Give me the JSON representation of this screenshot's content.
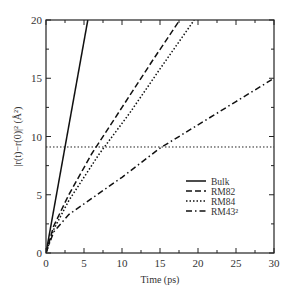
{
  "chart_data": {
    "type": "line",
    "title": "",
    "xlabel": "Time (ps)",
    "ylabel": "|r(t)−r(0)|² (Å²)",
    "xlim": [
      0,
      30
    ],
    "ylim": [
      0,
      20
    ],
    "xticks": [
      0,
      5,
      10,
      15,
      20,
      25,
      30
    ],
    "yticks": [
      0,
      5,
      10,
      15,
      20
    ],
    "legend_position": "center-right",
    "series": [
      {
        "name": "Bulk",
        "style": "solid",
        "x": [
          0,
          5.5
        ],
        "y": [
          0,
          20
        ]
      },
      {
        "name": "RM82",
        "style": "dashed",
        "x": [
          0,
          1,
          3,
          6,
          10,
          14,
          17.6
        ],
        "y": [
          0,
          2.3,
          5,
          8.5,
          12.5,
          16.5,
          20
        ]
      },
      {
        "name": "RM84",
        "style": "dotted",
        "x": [
          0,
          1,
          3,
          7,
          11,
          15,
          19.5
        ],
        "y": [
          0,
          2.0,
          4.5,
          8.5,
          12,
          15.8,
          20
        ]
      },
      {
        "name": "RM43²",
        "style": "dashdot",
        "x": [
          0,
          1,
          3,
          10,
          15,
          20,
          25,
          30
        ],
        "y": [
          0,
          1.8,
          3.3,
          6.5,
          9,
          11,
          13,
          15
        ]
      }
    ],
    "annotations": [
      {
        "type": "hline",
        "y": 9.1,
        "style": "dotted"
      }
    ]
  }
}
